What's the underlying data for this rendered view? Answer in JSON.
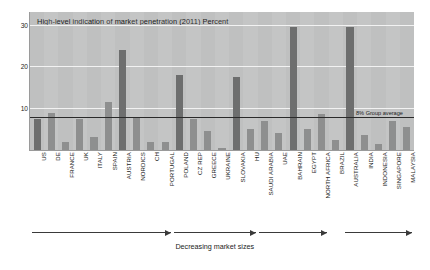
{
  "chart_data": {
    "type": "bar",
    "title": "High-level indication of market penetration (2011) Percent",
    "xlabel": "",
    "ylabel": "Percent",
    "ylim": [
      0,
      33
    ],
    "yticks": [
      10,
      20,
      30
    ],
    "grid": true,
    "legend_position": "none",
    "categories": [
      "US",
      "DE",
      "FRANCE",
      "UK",
      "ITALY",
      "SPAIN",
      "AUSTRIA",
      "NORDICS",
      "CH",
      "PORTUGAL",
      "POLAND",
      "CZ REP",
      "GREECE",
      "UKRAINE",
      "SLOVAKIA",
      "HU",
      "SAUDI ARABIA",
      "UAE",
      "BAHRAIN",
      "EGYPT",
      "NORTH AFRICA",
      "BRAZIL",
      "AUSTRALIA",
      "INDIA",
      "INDONESIA",
      "SINGAPORE",
      "MALAYSIA"
    ],
    "values": [
      7.5,
      8.8,
      2.0,
      7.5,
      3.0,
      11.5,
      24.0,
      8.0,
      1.8,
      2.0,
      18.0,
      7.5,
      4.5,
      0.6,
      17.5,
      5.0,
      7.0,
      4.0,
      29.5,
      5.0,
      8.5,
      2.5,
      29.5,
      3.5,
      1.5,
      7.0,
      5.5
    ],
    "annotations": [
      {
        "text": "8% Group average",
        "value": 8
      }
    ],
    "arrow_caption": "Decreasing market sizes",
    "arrow_groups": [
      {
        "label": "Europe developed",
        "from": "US",
        "to": "PORTUGAL"
      },
      {
        "label": "Europe emerging",
        "from": "POLAND",
        "to": "HU"
      },
      {
        "label": "Middle East / Africa",
        "from": "SAUDI ARABIA",
        "to": "NORTH AFRICA"
      },
      {
        "label": "Asia Pacific",
        "from": "AUSTRALIA",
        "to": "MALAYSIA"
      }
    ],
    "colors": {
      "plot_background": "#bfc0c0",
      "bar": "#8e8f8f",
      "bar_dark": "#6d6e6e",
      "gridline": "#f2f2f2",
      "average_line": "#2a2a2a",
      "text": "#1b1b1b"
    }
  },
  "axis": {
    "y_tick_labels": [
      "30",
      "20",
      "10"
    ]
  }
}
